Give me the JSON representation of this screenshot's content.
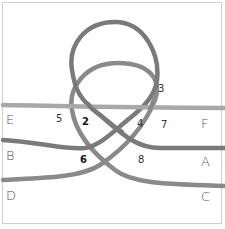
{
  "diagram": {
    "type": "knot-diagram",
    "colors": {
      "strand_dark": "#7c7c7c",
      "strand_light": "#a6a6a6",
      "frame": "#cfcfcf"
    },
    "end_labels": {
      "E": "E",
      "F": "F",
      "B": "B",
      "A": "A",
      "D": "D",
      "C": "C"
    },
    "crossing_labels": {
      "c2": "2",
      "c3": "3",
      "c4": "4",
      "c5": "5",
      "c6": "6",
      "c7": "7",
      "c8": "8"
    }
  }
}
